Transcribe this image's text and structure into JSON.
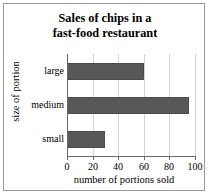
{
  "chart_data": {
    "type": "bar",
    "orientation": "horizontal",
    "title": "Sales of chips in a fast-food restaurant",
    "title_lines": [
      "Sales of chips in a",
      "fast-food restaurant"
    ],
    "categories": [
      "small",
      "medium",
      "large"
    ],
    "values": [
      30,
      95,
      60
    ],
    "display_order_top_to_bottom": [
      "large",
      "medium",
      "small"
    ],
    "xlabel": "number of portions sold",
    "ylabel": "size of portion",
    "xlim": [
      0,
      100
    ],
    "xticks": [
      0,
      20,
      40,
      60,
      80,
      100
    ],
    "xtick_labels": [
      "0",
      "20",
      "40",
      "60",
      "80",
      "100"
    ],
    "grid": "vertical",
    "legend": null,
    "bar_color": "#585858",
    "bar_edge_color": "#4a4a4a",
    "gridline_color": "#d2d2d2",
    "axis_color": "#6a6a6a",
    "background": "#ffffff",
    "border_color": "#9a9a9a"
  }
}
